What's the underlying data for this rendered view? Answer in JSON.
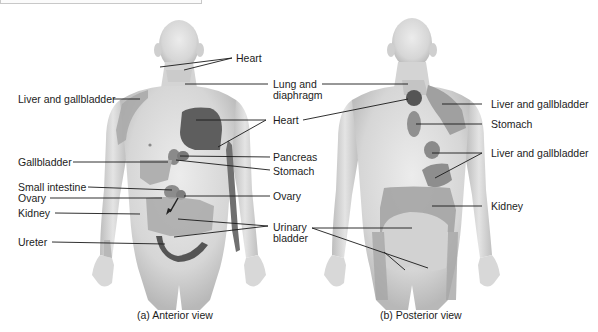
{
  "figure": {
    "type": "referred-pain-map",
    "panels": [
      {
        "id": "anterior",
        "caption": "(a) Anterior view",
        "labels": {
          "heart_face": "Heart",
          "lung_diaphragm_1": "Lung and",
          "lung_diaphragm_2": "diaphragm",
          "liver_gallbladder": "Liver and gallbladder",
          "heart_chest": "Heart",
          "gallbladder": "Gallbladder",
          "pancreas": "Pancreas",
          "stomach": "Stomach",
          "small_intestine": "Small intestine",
          "ovary_left": "Ovary",
          "ovary_right": "Ovary",
          "kidney": "Kidney",
          "urinary_bladder_1": "Urinary",
          "urinary_bladder_2": "bladder",
          "ureter": "Ureter"
        }
      },
      {
        "id": "posterior",
        "caption": "(b) Posterior view",
        "labels": {
          "liver_gallbladder_upper": "Liver and gallbladder",
          "stomach": "Stomach",
          "liver_gallbladder_lower": "Liver and gallbladder",
          "kidney": "Kidney"
        }
      }
    ],
    "colors": {
      "skin": "#d9d9d9",
      "skin_shadow": "#b9b9b9",
      "referred_zone": "#9c9c9c",
      "heart_zone": "#5a5a5a",
      "leader_line": "#1a1a1a"
    }
  },
  "bleed_text": {
    "line1": "",
    "line2": "",
    "line3": ""
  }
}
